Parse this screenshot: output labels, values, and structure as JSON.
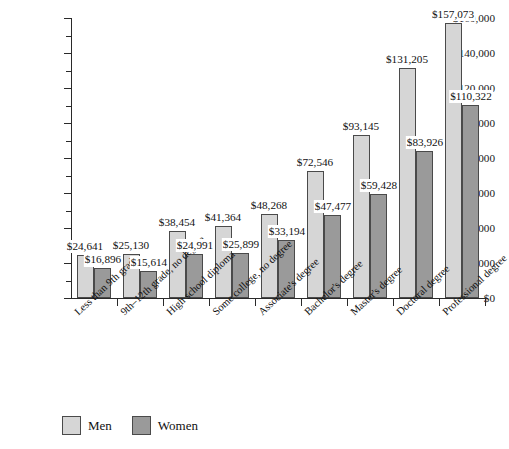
{
  "chart_data": {
    "type": "bar",
    "title": "",
    "subtitle": "",
    "xlabel": "",
    "ylabel": "",
    "ylim": [
      0,
      160000
    ],
    "ytick_step": 20000,
    "yminor_step": 10000,
    "grid": false,
    "legend_position": "bottom-left",
    "categories": [
      "Less than 9th grade",
      "9th–12th grade, no degree",
      "High school diploma",
      "Some college, no degree",
      "Associate's degree",
      "Bachelor's degree",
      "Master's degree",
      "Doctoral degree",
      "Professional degree"
    ],
    "ytick_labels": [
      "$0",
      "$20,000",
      "$40,000",
      "$60,000",
      "$80,000",
      "$100,000",
      "$120,000",
      "$140,000",
      "$160,000"
    ],
    "ytick_values": [
      0,
      20000,
      40000,
      60000,
      80000,
      100000,
      120000,
      140000,
      160000
    ],
    "series": [
      {
        "name": "Men",
        "color": "#d6d6d6",
        "values": [
          24641,
          25130,
          38454,
          41364,
          48268,
          72546,
          93145,
          131205,
          157073
        ],
        "labels": [
          "$24,641",
          "$25,130",
          "$38,454",
          "$41,364",
          "$48,268",
          "$72,546",
          "$93,145",
          "$131,205",
          "$157,073"
        ]
      },
      {
        "name": "Women",
        "color": "#9a9a9a",
        "values": [
          16896,
          15614,
          24991,
          25899,
          33194,
          47477,
          59428,
          83926,
          110322
        ],
        "labels": [
          "$16,896",
          "$15,614",
          "$24,991",
          "$25,899",
          "$33,194",
          "$47,477",
          "$59,428",
          "$83,926",
          "$110,322"
        ]
      }
    ]
  },
  "legend": {
    "items": [
      {
        "label": "Men",
        "color": "#d6d6d6"
      },
      {
        "label": "Women",
        "color": "#9a9a9a"
      }
    ]
  },
  "colors": {
    "men_bar": "#d6d6d6",
    "women_bar": "#9a9a9a",
    "bar_border": "#4a4a4a",
    "axis": "#2a2a2a",
    "background": "#ffffff",
    "text": "#111111"
  }
}
